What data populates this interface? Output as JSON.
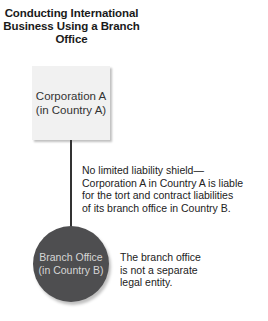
{
  "diagram": {
    "title_lines": [
      "Conducting International",
      "Business Using a Branch",
      "Office"
    ],
    "parent": {
      "line1": "Corporation A",
      "line2": "(in Country A)",
      "fill": "#f1f1f1"
    },
    "liability_note": {
      "lines": [
        "No limited liability shield—",
        "Corporation A in Country A is liable",
        "for the tort and contract liabilities",
        "of its branch office in Country B."
      ]
    },
    "branch": {
      "line1": "Branch Office",
      "line2": "(in Country B)",
      "fill": "#4e4e50"
    },
    "entity_note": {
      "lines": [
        "The branch office",
        "is not a separate",
        "legal entity."
      ]
    }
  }
}
